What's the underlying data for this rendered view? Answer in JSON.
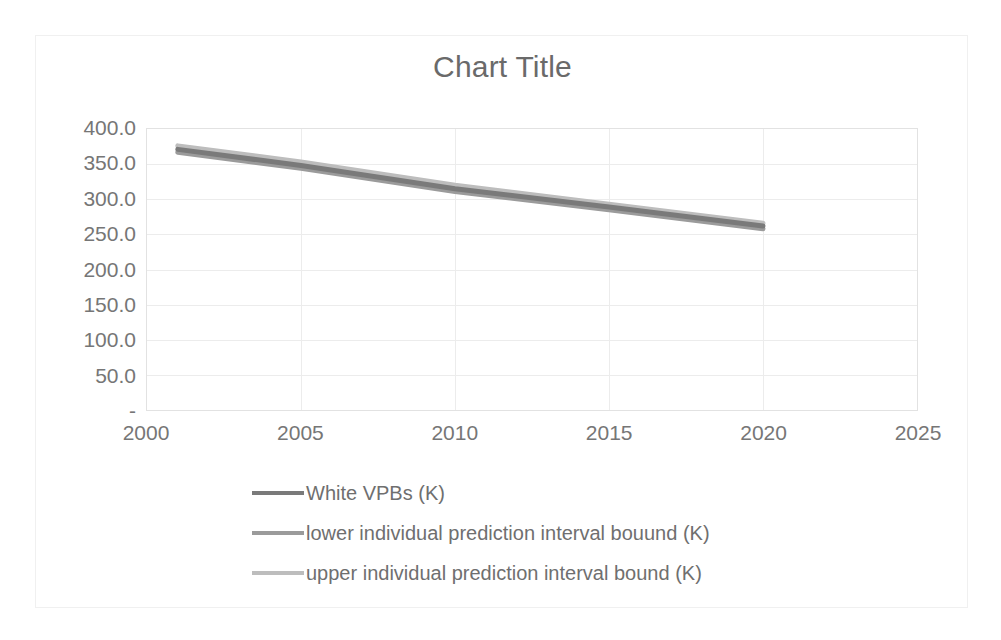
{
  "chart_data": {
    "type": "line",
    "title": "Chart Title",
    "xlabel": "",
    "ylabel": "",
    "xlim": [
      2000,
      2025
    ],
    "ylim": [
      0,
      400
    ],
    "x_ticks": [
      "2000",
      "2005",
      "2010",
      "2015",
      "2020",
      "2025"
    ],
    "x_tick_values": [
      2000,
      2005,
      2010,
      2015,
      2020,
      2025
    ],
    "y_ticks": [
      "400.0",
      "350.0",
      "300.0",
      "250.0",
      "200.0",
      "150.0",
      "100.0",
      "50.0",
      "-"
    ],
    "y_tick_values": [
      400,
      350,
      300,
      250,
      200,
      150,
      100,
      50,
      0
    ],
    "grid": "horizontal-and-vertical",
    "legend_position": "bottom",
    "x": [
      2001,
      2005,
      2010,
      2015,
      2020
    ],
    "series": [
      {
        "name": "White VPBs (K)",
        "color": "#7a7a7a",
        "values": [
          371,
          348,
          315,
          289,
          262
        ]
      },
      {
        "name": "lower individual prediction interval bouund (K)",
        "color": "#9b9b9b",
        "values": [
          367,
          344,
          311,
          285,
          258
        ]
      },
      {
        "name": "upper individual prediction interval bound (K)",
        "color": "#bdbdbd",
        "values": [
          376,
          353,
          320,
          293,
          266
        ]
      }
    ]
  },
  "chart": {
    "title": "Chart Title",
    "axis": {
      "y_ticks": [
        "400.0",
        "350.0",
        "300.0",
        "250.0",
        "200.0",
        "150.0",
        "100.0",
        "50.0",
        "-"
      ],
      "x_ticks": [
        "2000",
        "2005",
        "2010",
        "2015",
        "2020",
        "2025"
      ]
    },
    "legend": {
      "items": [
        {
          "label": "White VPBs (K)",
          "color": "#7a7a7a"
        },
        {
          "label": "lower individual prediction interval bouund (K)",
          "color": "#9b9b9b"
        },
        {
          "label": "upper individual prediction interval bound (K)",
          "color": "#bdbdbd"
        }
      ]
    },
    "colors": {
      "text": "#6a6a6a",
      "grid": "#ececec",
      "plot_border": "#e2e2e2",
      "frame_border": "#f0f0f0"
    }
  }
}
